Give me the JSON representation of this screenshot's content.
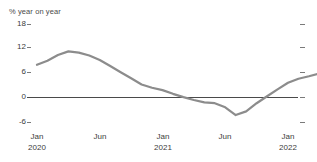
{
  "chart_data": {
    "type": "line",
    "title": "",
    "subtitle": "",
    "ylabel": "% year on year",
    "xlabel": "",
    "ylim": [
      -6,
      18
    ],
    "yticks": [
      18,
      12,
      6,
      0,
      -6
    ],
    "ytick_labels": [
      "18",
      "12",
      "6",
      "0",
      "-6"
    ],
    "grid": false,
    "legend": null,
    "zero_line": 0,
    "x": [
      "Jan 2020",
      "Feb 2020",
      "Mar 2020",
      "Apr 2020",
      "May 2020",
      "Jun 2020",
      "Jul 2020",
      "Aug 2020",
      "Sep 2020",
      "Oct 2020",
      "Nov 2020",
      "Dec 2020",
      "Jan 2021",
      "Feb 2021",
      "Mar 2021",
      "Apr 2021",
      "May 2021",
      "Jun 2021",
      "Jul 2021",
      "Aug 2021",
      "Sep 2021",
      "Oct 2021",
      "Nov 2021",
      "Dec 2021",
      "Jan 2022",
      "Feb 2022"
    ],
    "xtick_labels": [
      {
        "month": "Jan",
        "year": "2020"
      },
      {
        "month": "Jun",
        "year": ""
      },
      {
        "month": "Jan",
        "year": "2021"
      },
      {
        "month": "Jun",
        "year": ""
      },
      {
        "month": "Jan",
        "year": "2022"
      }
    ],
    "series": [
      {
        "name": "% year on year",
        "color": "#8c8c8c",
        "values": [
          8.0,
          9.0,
          10.4,
          11.3,
          11.0,
          10.3,
          9.2,
          7.7,
          6.2,
          4.7,
          3.2,
          2.4,
          1.8,
          0.9,
          0.1,
          -0.6,
          -1.2,
          -1.4,
          -2.4,
          -4.3,
          -3.4,
          -1.4,
          0.3,
          2.0,
          3.6,
          4.6
        ]
      }
    ],
    "series_extra": {
      "tail_x": [
        "Mar 2022",
        "Apr 2022",
        "May 2022"
      ],
      "tail_values": [
        5.2,
        5.9,
        9.6
      ]
    }
  }
}
